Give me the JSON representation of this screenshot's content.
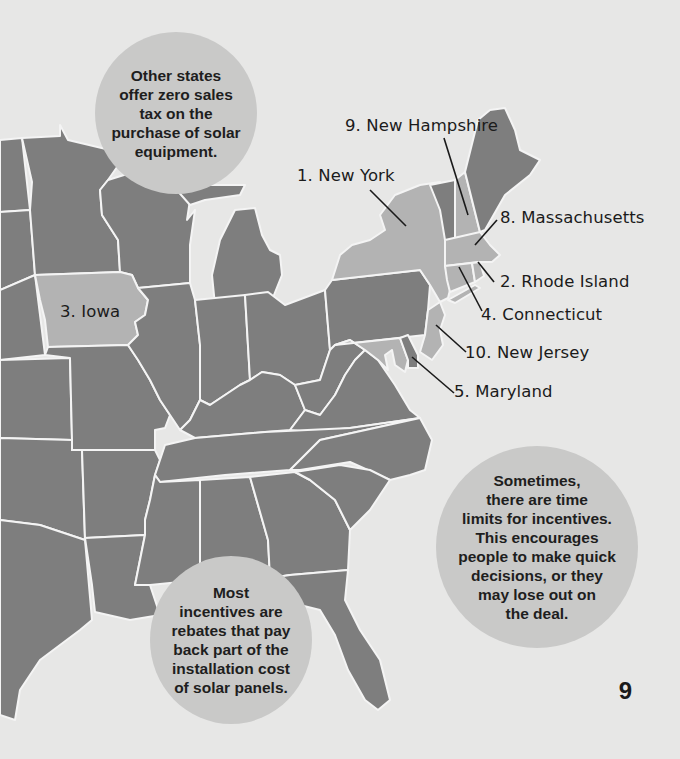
{
  "colors": {
    "background": "#e7e7e6",
    "state_default": "#7e7e7e",
    "state_highlighted": "#b3b3b3",
    "bubble": "#c9c9c8",
    "border": "#f4f4f4",
    "text": "#1b1b1b"
  },
  "map": {
    "highlighted_states": [
      "New York",
      "Rhode Island",
      "Iowa",
      "Connecticut",
      "Maryland",
      "Massachusetts",
      "New Hampshire",
      "New Jersey"
    ],
    "labels": {
      "new_hampshire": "9. New Hampshire",
      "new_york": "1. New York",
      "massachusetts": "8. Massachusetts",
      "rhode_island": "2. Rhode Island",
      "connecticut": "4. Connecticut",
      "new_jersey": "10. New Jersey",
      "maryland": "5. Maryland",
      "iowa": "3. Iowa"
    }
  },
  "bubbles": {
    "sales_tax": "Other states\noffer zero sales\ntax on the\npurchase of solar\nequipment.",
    "time_limits": "Sometimes,\nthere are time\nlimits for incentives.\nThis encourages\npeople to make quick\ndecisions, or they\nmay lose out on\nthe deal.",
    "rebates": "Most\nincentives are\nrebates that pay\nback part of the\ninstallation cost\nof solar panels."
  },
  "page": {
    "number": "9"
  }
}
